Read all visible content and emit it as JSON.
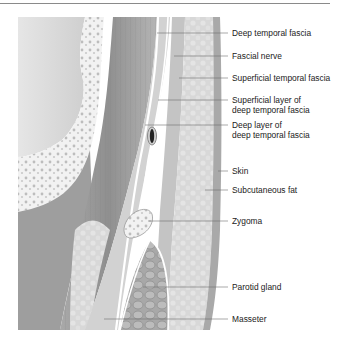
{
  "figure": {
    "labels": [
      {
        "id": "deep-temporal-fascia",
        "text": "Deep temporal fascia",
        "x": 232,
        "y": 29
      },
      {
        "id": "fascial-nerve",
        "text": "Fascial nerve",
        "x": 232,
        "y": 52
      },
      {
        "id": "superficial-temporal-fascia",
        "text": "Superficial temporal fascia",
        "x": 232,
        "y": 74
      },
      {
        "id": "superficial-layer-ddtf-1",
        "text": "Superficial layer of",
        "x": 232,
        "y": 96
      },
      {
        "id": "superficial-layer-ddtf-2",
        "text": "deep temporal fascia",
        "x": 232,
        "y": 106
      },
      {
        "id": "deep-layer-dtf-1",
        "text": "Deep layer of",
        "x": 232,
        "y": 120
      },
      {
        "id": "deep-layer-dtf-2",
        "text": "deep temporal fascia",
        "x": 232,
        "y": 130
      },
      {
        "id": "skin",
        "text": "Skin",
        "x": 232,
        "y": 168
      },
      {
        "id": "subcutaneous-fat",
        "text": "Subcutaneous fat",
        "x": 232,
        "y": 186
      },
      {
        "id": "zygoma",
        "text": "Zygoma",
        "x": 232,
        "y": 218
      },
      {
        "id": "parotid-gland",
        "text": "Parotid gland",
        "x": 232,
        "y": 283
      },
      {
        "id": "masseter",
        "text": "Masseter",
        "x": 232,
        "y": 315
      }
    ],
    "leaders": [
      {
        "to": "deep-temporal-fascia",
        "x1": 157,
        "y": 33
      },
      {
        "to": "fascial-nerve",
        "x1": 174,
        "y": 56
      },
      {
        "to": "superficial-temporal-fascia",
        "x1": 179,
        "y": 78
      },
      {
        "to": "superficial-layer",
        "x1": 158,
        "y": 100
      },
      {
        "to": "deep-layer",
        "x1": 145,
        "y": 125
      },
      {
        "to": "skin",
        "x1": 218,
        "y": 171
      },
      {
        "to": "subcutaneous-fat",
        "x1": 205,
        "y": 190
      },
      {
        "to": "zygoma",
        "x1": 148,
        "y": 221
      },
      {
        "to": "parotid-gland",
        "x1": 143,
        "y": 287
      },
      {
        "to": "masseter",
        "x1": 104,
        "y": 319
      }
    ],
    "colors": {
      "text": "#222222",
      "leader": "#6e6e6e",
      "border": "#8a8a8a"
    }
  }
}
